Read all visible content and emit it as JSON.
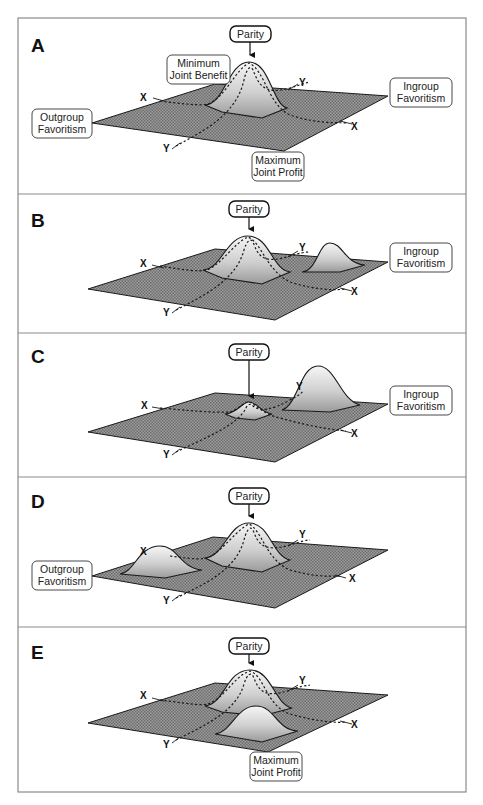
{
  "figure": {
    "colors": {
      "plane": "#8e8e8e",
      "hill_top": "#f4f4f4",
      "hill_base": "#9a9a9a",
      "frame": "#8a8a8a",
      "ink": "#111111"
    },
    "axis_labels": {
      "x": "X",
      "y": "Y"
    },
    "panels": [
      {
        "letter": "A",
        "parity_label": "Parity",
        "labels": {
          "min_joint_benefit": "Minimum\nJoint Benefit",
          "min_joint_benefit_l1": "Minimum",
          "min_joint_benefit_l2": "Joint Benefit",
          "outgroup_l1": "Outgroup",
          "outgroup_l2": "Favoritism",
          "ingroup_l1": "Ingroup",
          "ingroup_l2": "Favoritism",
          "max_joint_profit_l1": "Maximum",
          "max_joint_profit_l2": "Joint Profit"
        },
        "peaks": [
          {
            "location": "parity-center",
            "height": "high"
          }
        ]
      },
      {
        "letter": "B",
        "parity_label": "Parity",
        "labels": {
          "ingroup_l1": "Ingroup",
          "ingroup_l2": "Favoritism"
        },
        "peaks": [
          {
            "location": "parity-center",
            "height": "high"
          },
          {
            "location": "ingroup",
            "height": "medium"
          }
        ]
      },
      {
        "letter": "C",
        "parity_label": "Parity",
        "labels": {
          "ingroup_l1": "Ingroup",
          "ingroup_l2": "Favoritism"
        },
        "peaks": [
          {
            "location": "parity-center",
            "height": "low"
          },
          {
            "location": "ingroup",
            "height": "high"
          }
        ]
      },
      {
        "letter": "D",
        "parity_label": "Parity",
        "labels": {
          "outgroup_l1": "Outgroup",
          "outgroup_l2": "Favoritism"
        },
        "peaks": [
          {
            "location": "outgroup",
            "height": "medium"
          },
          {
            "location": "parity-center",
            "height": "high"
          }
        ]
      },
      {
        "letter": "E",
        "parity_label": "Parity",
        "labels": {
          "max_joint_profit_l1": "Maximum",
          "max_joint_profit_l2": "Joint Profit"
        },
        "peaks": [
          {
            "location": "parity-center",
            "height": "high"
          },
          {
            "location": "max-joint-profit",
            "height": "medium"
          }
        ]
      }
    ]
  }
}
